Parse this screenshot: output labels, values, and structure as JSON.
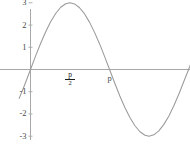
{
  "chart_data": {
    "type": "line",
    "title": "",
    "xlabel": "",
    "ylabel": "",
    "function": "3 sin(x)",
    "amplitude": 3,
    "xlim": [
      -0.45,
      7.1
    ],
    "ylim": [
      -3.45,
      3.3
    ],
    "grid": false,
    "legend": null,
    "y_ticks": [
      3,
      2,
      1,
      -1,
      -2,
      -3
    ],
    "y_tick_labels": [
      "3",
      "2",
      "1",
      "-1",
      "-2",
      "-3"
    ],
    "x_ticks": [
      1.5708,
      3.1416
    ],
    "x_tick_labels": [
      "p/2",
      "p"
    ],
    "x_tick_label_parts": [
      {
        "numerator": "p",
        "denominator": "2"
      },
      {
        "numerator": "p",
        "denominator": ""
      }
    ],
    "zero_crossings": [
      0,
      3.1416,
      6.2832
    ],
    "maxima": [
      {
        "x": 1.5708,
        "y": 3
      },
      {
        "x": 7.85,
        "y": 3
      }
    ],
    "minima": [
      {
        "x": 4.7124,
        "y": -3
      }
    ],
    "points": [
      {
        "x": -0.45,
        "y": -1.3
      },
      {
        "x": -0.3,
        "y": -0.89
      },
      {
        "x": -0.15,
        "y": -0.45
      },
      {
        "x": 0.0,
        "y": 0.0
      },
      {
        "x": 0.2,
        "y": 0.6
      },
      {
        "x": 0.4,
        "y": 1.17
      },
      {
        "x": 0.6,
        "y": 1.69
      },
      {
        "x": 0.8,
        "y": 2.15
      },
      {
        "x": 1.0,
        "y": 2.52
      },
      {
        "x": 1.2,
        "y": 2.8
      },
      {
        "x": 1.4,
        "y": 2.96
      },
      {
        "x": 1.5708,
        "y": 3.0
      },
      {
        "x": 1.75,
        "y": 2.95
      },
      {
        "x": 1.95,
        "y": 2.78
      },
      {
        "x": 2.15,
        "y": 2.5
      },
      {
        "x": 2.35,
        "y": 2.12
      },
      {
        "x": 2.55,
        "y": 1.66
      },
      {
        "x": 2.75,
        "y": 1.14
      },
      {
        "x": 2.95,
        "y": 0.57
      },
      {
        "x": 3.1416,
        "y": 0.0
      },
      {
        "x": 3.35,
        "y": -0.62
      },
      {
        "x": 3.55,
        "y": -1.19
      },
      {
        "x": 3.75,
        "y": -1.71
      },
      {
        "x": 3.95,
        "y": -2.16
      },
      {
        "x": 4.15,
        "y": -2.53
      },
      {
        "x": 4.35,
        "y": -2.8
      },
      {
        "x": 4.55,
        "y": -2.96
      },
      {
        "x": 4.7124,
        "y": -3.0
      },
      {
        "x": 4.9,
        "y": -2.94
      },
      {
        "x": 5.1,
        "y": -2.76
      },
      {
        "x": 5.3,
        "y": -2.47
      },
      {
        "x": 5.5,
        "y": -2.09
      },
      {
        "x": 5.7,
        "y": -1.62
      },
      {
        "x": 5.9,
        "y": -1.09
      },
      {
        "x": 6.1,
        "y": -0.52
      },
      {
        "x": 6.2832,
        "y": 0.0
      },
      {
        "x": 6.45,
        "y": 0.5
      },
      {
        "x": 6.65,
        "y": 1.08
      },
      {
        "x": 6.85,
        "y": 1.61
      },
      {
        "x": 7.1,
        "y": 2.16
      }
    ],
    "curve_color": "#9a9a9a",
    "axis_color": "#a8a8a8",
    "background_color": "#ffffff"
  },
  "axes": {
    "y_labels": [
      {
        "text": "3",
        "value": 3
      },
      {
        "text": "2",
        "value": 2
      },
      {
        "text": "1",
        "value": 1
      },
      {
        "text": "-1",
        "value": -1
      },
      {
        "text": "-2",
        "value": -2
      },
      {
        "text": "-3",
        "value": -3
      }
    ],
    "x_labels": [
      {
        "numerator": "p",
        "denominator": "2",
        "value": 1.5708
      },
      {
        "text": "p",
        "value": 3.1416
      }
    ]
  }
}
